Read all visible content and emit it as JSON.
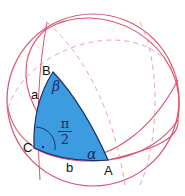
{
  "figure": {
    "vertices": {
      "A": "A",
      "B": "B",
      "C": "C"
    },
    "sides": {
      "a": "a",
      "b": "b"
    },
    "angles": {
      "alpha": "α",
      "beta": "β",
      "right_angle_num": "π",
      "right_angle_den": "2"
    },
    "right_angle_marker": "·",
    "colors": {
      "circle": "#d9546e",
      "circle_dashed": "#e7a7b4",
      "triangle_fill": "#3d9be0",
      "triangle_edge": "#1f2f6b",
      "text": "#111111",
      "greek": "#1a2a6e"
    }
  }
}
